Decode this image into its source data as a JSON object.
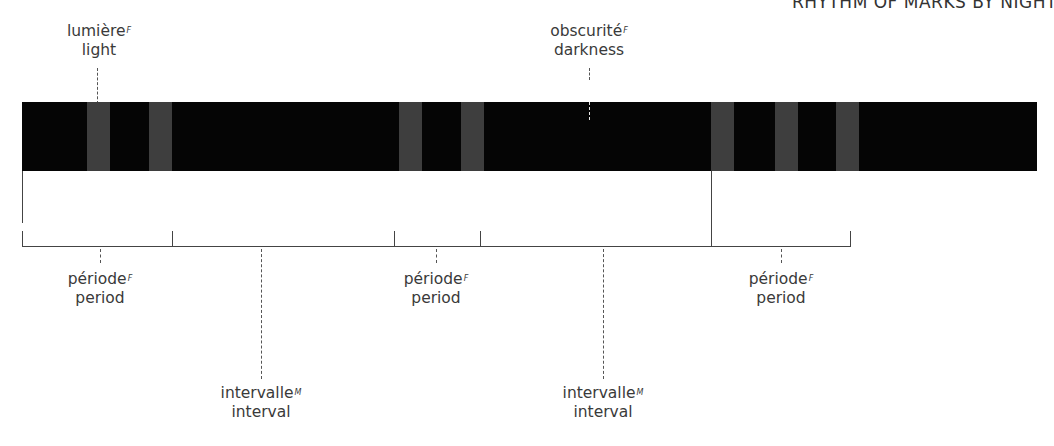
{
  "header": {
    "title": "RHYTHM OF MARKS BY NIGHT"
  },
  "diagram": {
    "bar": {
      "color": "#050505",
      "stripe_color": "#3e3e3e"
    },
    "top_labels": [
      {
        "fr": "lumière",
        "gender": "F",
        "en": "light"
      },
      {
        "fr": "obscurité",
        "gender": "F",
        "en": "darkness"
      }
    ],
    "bottom_labels": [
      {
        "fr": "période",
        "gender": "F",
        "en": "period"
      },
      {
        "fr": "intervalle",
        "gender": "M",
        "en": "interval"
      },
      {
        "fr": "période",
        "gender": "F",
        "en": "period"
      },
      {
        "fr": "intervalle",
        "gender": "M",
        "en": "interval"
      },
      {
        "fr": "période",
        "gender": "F",
        "en": "period"
      }
    ]
  }
}
